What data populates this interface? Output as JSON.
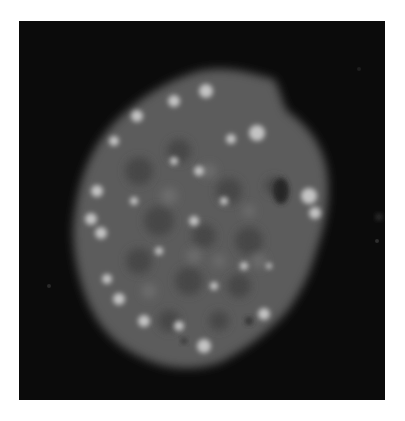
{
  "image": {
    "description": "Grayscale fluorescence micrograph of a single cell nucleus with bright punctate foci on a black background",
    "alt": "Fluorescence microscopy image of a nucleus",
    "colors": {
      "page_background": "#ffffff",
      "frame_background": "#0b0b0b",
      "nucleus_body": "#5a5a5a",
      "nucleus_dark_patches": "#4a4a4a",
      "bright_foci": "#bdbdbd"
    }
  }
}
